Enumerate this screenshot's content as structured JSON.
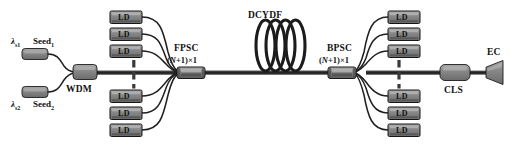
{
  "figure": {
    "type": "optical-fiber-amplifier-schematic",
    "background": "#ffffff",
    "colors": {
      "component_fill": "#7a7a7a",
      "component_fill_light": "#9a9a9a",
      "component_stroke": "#1c1c1c",
      "fiber": "#2b2b2b",
      "text": "#111111"
    }
  },
  "labels": {
    "lambda_s1": "λ",
    "lambda_s1_sub": "s1",
    "lambda_s2": "λ",
    "lambda_s2_sub": "s2",
    "seed1": "Seed",
    "seed1_sub": "1",
    "seed2": "Seed",
    "seed2_sub": "2",
    "wdm": "WDM",
    "fpsc": "FPSC",
    "fpsc_ratio_pre": "(",
    "fpsc_ratio_n": "N",
    "fpsc_ratio_post": "+1)×1",
    "dcydf": "DCYDF",
    "bpsc": "BPSC",
    "bpsc_ratio_pre": "(",
    "bpsc_ratio_n": "N",
    "bpsc_ratio_post": "+1)×1",
    "cls": "CLS",
    "ec": "EC",
    "ld": "LD"
  },
  "components": {
    "seeds": [
      {
        "name": "seed-1",
        "label": "Seed",
        "subscript": "1",
        "wavelength": "λs1"
      },
      {
        "name": "seed-2",
        "label": "Seed",
        "subscript": "2",
        "wavelength": "λs2"
      }
    ],
    "wdm": {
      "name": "wdm",
      "label": "WDM",
      "description": "wavelength division multiplexer"
    },
    "forward_pump": {
      "name": "fpsc",
      "label": "FPSC",
      "ratio": "(N+1)×1",
      "description": "forward pump signal combiner",
      "ld_count_top": 3,
      "ld_count_bottom": 3,
      "ellipsis": "vertical-dashed"
    },
    "gain_fiber": {
      "name": "dcydf",
      "label": "DCYDF",
      "loops": 4,
      "description": "double-clad Yb-doped fiber"
    },
    "backward_pump": {
      "name": "bpsc",
      "label": "BPSC",
      "ratio": "(N+1)×1",
      "description": "backward pump signal combiner",
      "ld_count_top": 3,
      "ld_count_bottom": 3,
      "ellipsis": "vertical-dashed"
    },
    "cladding_stripper": {
      "name": "cls",
      "label": "CLS",
      "description": "cladding light stripper"
    },
    "end_cap": {
      "name": "ec",
      "label": "EC",
      "description": "end cap"
    }
  },
  "ld_boxes": {
    "label": "LD",
    "left_top": [
      {
        "x": 110,
        "y": 11
      },
      {
        "x": 110,
        "y": 28
      },
      {
        "x": 110,
        "y": 45
      }
    ],
    "left_bottom": [
      {
        "x": 110,
        "y": 90
      },
      {
        "x": 110,
        "y": 107
      },
      {
        "x": 110,
        "y": 124
      }
    ],
    "right_top": [
      {
        "x": 388,
        "y": 11
      },
      {
        "x": 388,
        "y": 28
      },
      {
        "x": 388,
        "y": 45
      }
    ],
    "right_bottom": [
      {
        "x": 388,
        "y": 90
      },
      {
        "x": 388,
        "y": 107
      },
      {
        "x": 388,
        "y": 124
      }
    ]
  }
}
